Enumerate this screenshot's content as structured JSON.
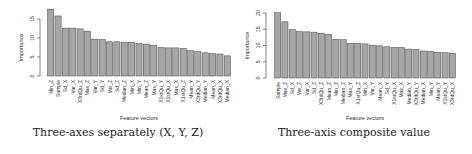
{
  "chart_data": [
    {
      "type": "bar",
      "title": "",
      "caption": "Three-axes separately (X, Y, Z)",
      "xlabel": "Feature vectors",
      "ylabel": "Importance",
      "ylim": [
        0,
        17
      ],
      "yticks": [
        0,
        5,
        10,
        15
      ],
      "grid": false,
      "bar_color": "#a6a6a6",
      "categories": [
        "Min_Z",
        "Sample",
        "Sd_X",
        "Var_X",
        "X3rdQu_Z",
        "Max_Z",
        "Var_Y",
        "Sd_Y",
        "Var_Z",
        "Sd_Z",
        "Median_Z",
        "Min_X",
        "Min_Y",
        "Mean_Z",
        "Max_Y",
        "X1stQu_Y",
        "X1stQu_X",
        "Max_X",
        "X1stQu_Z",
        "Mean_Y",
        "X3rdQu_Y",
        "Median_Y",
        "Mean_X",
        "X3rdQu_X",
        "Median_X"
      ],
      "values": [
        17.6,
        15.8,
        12.6,
        12.6,
        12.4,
        11.8,
        9.7,
        9.6,
        9.0,
        9.0,
        8.9,
        8.9,
        8.5,
        8.4,
        8.1,
        7.5,
        7.4,
        7.4,
        7.2,
        6.7,
        6.4,
        6.1,
        5.9,
        5.8,
        5.3
      ]
    },
    {
      "type": "bar",
      "title": "",
      "caption": "Three-axis composite value",
      "xlabel": "Feature vectors",
      "ylabel": "Importance",
      "ylim": [
        0,
        20
      ],
      "yticks": [
        0,
        5,
        10,
        15,
        20
      ],
      "grid": false,
      "bar_color": "#a6a6a6",
      "categories": [
        "Sample",
        "Max_Z",
        "Sd_X",
        "Var_Z",
        "Var_X",
        "Sd_Z",
        "X3rdQu_Z",
        "Mean_Z",
        "Min_Z",
        "Median_Z",
        "Max_Y",
        "X1stQu_Z",
        "Min_X",
        "Var_Y",
        "Mean_X",
        "Sd_Y",
        "X1stQu_X",
        "Max_X",
        "Median_Y",
        "X3rdQu_Y",
        "Median_X",
        "Min_Y",
        "Mean_Y",
        "X1stQu_Y",
        "X3rdQu_X"
      ],
      "values": [
        20.1,
        17.3,
        14.9,
        14.3,
        14.2,
        14.1,
        13.8,
        13.4,
        11.9,
        11.8,
        10.7,
        10.6,
        10.5,
        10.1,
        9.9,
        9.6,
        9.4,
        9.4,
        8.9,
        8.8,
        8.3,
        8.2,
        7.9,
        7.8,
        7.6
      ]
    }
  ]
}
